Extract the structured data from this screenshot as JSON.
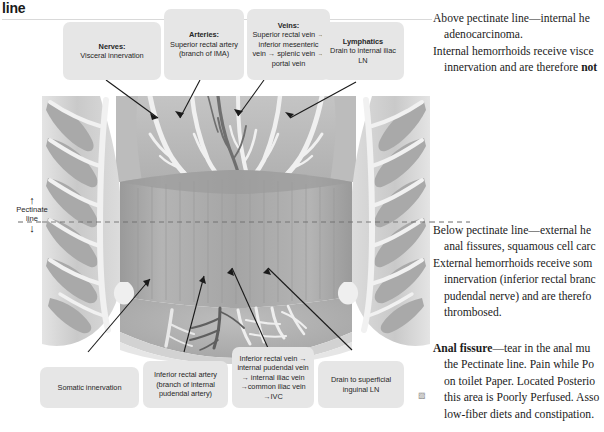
{
  "header": {
    "running_head": "line"
  },
  "pectinate_marker": {
    "arrow_up": "↑",
    "label_line1": "Pectinate",
    "label_line2": "line",
    "arrow_down": "↓"
  },
  "callouts_top": [
    {
      "name": "nerves",
      "title": "Nerves:",
      "body": "Visceral innervation"
    },
    {
      "name": "arteries",
      "title": "Arteries:",
      "body": "Superior rectal artery (branch of IMA)"
    },
    {
      "name": "veins",
      "title": "Veins:",
      "body": "Superior rectal vein → inferior mesenteric vein → splenic vein → portal vein"
    },
    {
      "name": "lymphatics",
      "title": "Lymphatics",
      "body": "Drain to internal iliac LN"
    }
  ],
  "callouts_bottom": [
    {
      "name": "somatic-innervation",
      "title": "",
      "body": "Somatic innervation"
    },
    {
      "name": "inferior-rectal-artery",
      "title": "",
      "body": "Inferior rectal artery (branch of internal pudendal artery)"
    },
    {
      "name": "inferior-rectal-vein",
      "title": "",
      "body": "Inferior rectal vein → internal pudendal vein → internal iliac vein →common iliac vein →IVC"
    },
    {
      "name": "superficial-inguinal-ln",
      "title": "",
      "body": "Drain to superficial inguinal LN"
    }
  ],
  "body_text": {
    "top": [
      "Above pectinate line—internal he",
      "adenocarcinoma.",
      "Internal hemorrhoids receive visce",
      "innervation and are therefore "
    ],
    "top_bold_tail": "not",
    "middle": [
      "Below pectinate line—external he",
      "anal fissures, squamous cell carc",
      "External hemorrhoids receive som",
      "innervation (inferior rectal branc",
      "pudendal nerve) and are therefo",
      "thrombosed."
    ],
    "bottom_lead": "Anal fissure",
    "bottom": [
      "—tear in the anal mu",
      "the Pectinate line. Pain while Po",
      "on toilet Paper. Located Posterio",
      "this area is Poorly Perfused. Asso",
      "low-fiber diets and constipation."
    ]
  },
  "colors": {
    "callout_bg": "#e6e6e6",
    "callout_text": "#262626",
    "body_text": "#1b1b1b",
    "leader_line": "#1a1a1a",
    "pectinate_dash": "#6b6b6b",
    "tissue_light": "#d8d8d8",
    "tissue_mid": "#bdbdbd",
    "tissue_dark": "#9d9d9d",
    "vessel_white": "#f2f2f2",
    "lumen": "#a8a8a8"
  },
  "diagram": {
    "name": "anal-canal-cross-section"
  }
}
